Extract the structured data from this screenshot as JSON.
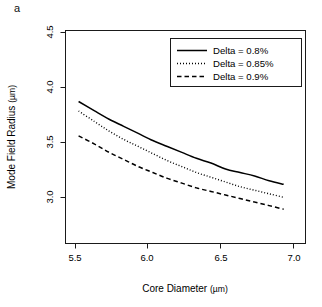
{
  "figure": {
    "panel_label": "a",
    "background_color": "#ffffff",
    "foreground_color": "#000000"
  },
  "chart_data": {
    "type": "line",
    "title": "",
    "panel": "a",
    "xlabel": "Core Diameter",
    "xlabel_unit": "(µm)",
    "ylabel": "Mode Field Radius",
    "ylabel_unit": "(µm)",
    "xlim": [
      5.4,
      7.05
    ],
    "ylim": [
      2.82,
      4.62
    ],
    "xticks": [
      5.5,
      6.0,
      6.5,
      7.0
    ],
    "xticklabels": [
      "5.5",
      "6.0",
      "6.5",
      "7.0"
    ],
    "yticks": [
      3.0,
      3.5,
      4.0,
      4.5
    ],
    "yticklabels": [
      "3.0",
      "3.5",
      "4.0",
      "4.5"
    ],
    "grid": false,
    "legend_position": "top-right",
    "x": [
      5.49,
      5.6,
      5.7,
      5.8,
      5.9,
      6.0,
      6.1,
      6.2,
      6.3,
      6.4,
      6.5,
      6.6,
      6.7,
      6.8,
      6.9
    ],
    "series": [
      {
        "name": "Delta = 0.8%",
        "linestyle": "solid",
        "color": "#000000",
        "values": [
          4.02,
          3.94,
          3.87,
          3.81,
          3.75,
          3.69,
          3.64,
          3.59,
          3.54,
          3.5,
          3.45,
          3.42,
          3.39,
          3.35,
          3.32
        ]
      },
      {
        "name": "Delta = 0.85%",
        "linestyle": "dotted",
        "color": "#000000",
        "values": [
          3.94,
          3.85,
          3.77,
          3.7,
          3.64,
          3.58,
          3.52,
          3.47,
          3.42,
          3.38,
          3.34,
          3.3,
          3.27,
          3.24,
          3.21
        ]
      },
      {
        "name": "Delta = 0.9%",
        "linestyle": "dashed",
        "color": "#000000",
        "values": [
          3.73,
          3.66,
          3.59,
          3.53,
          3.47,
          3.42,
          3.37,
          3.33,
          3.29,
          3.26,
          3.23,
          3.2,
          3.17,
          3.14,
          3.11
        ]
      }
    ]
  },
  "legend": {
    "entries": [
      {
        "label": "Delta = 0.8%",
        "style": "solid"
      },
      {
        "label": "Delta = 0.85%",
        "style": "dotted"
      },
      {
        "label": "Delta = 0.9%",
        "style": "dashed"
      }
    ]
  },
  "axes": {
    "x_tick_labels": [
      "5.5",
      "6.0",
      "6.5",
      "7.0"
    ],
    "y_tick_labels": [
      "3.0",
      "3.5",
      "4.0",
      "4.5"
    ],
    "x_title": "Core Diameter",
    "x_unit": "(µm)",
    "y_title": "Mode Field Radius",
    "y_unit": "(µm)"
  }
}
